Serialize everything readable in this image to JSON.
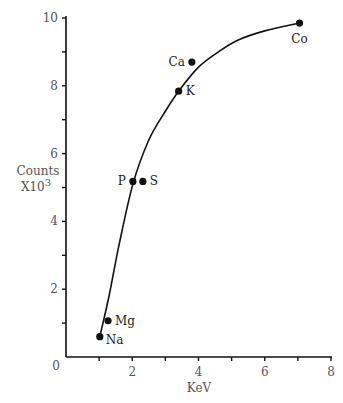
{
  "chart_data": {
    "type": "scatter",
    "title": "",
    "xlabel": "KeV",
    "ylabel_line1": "Counts",
    "ylabel_line2": "X10",
    "ylabel_sup": "3",
    "xlim": [
      0,
      8
    ],
    "ylim": [
      0,
      10
    ],
    "x_ticks": [
      0,
      1,
      2,
      3,
      4,
      5,
      6,
      7,
      8
    ],
    "x_tick_labels": [
      "0",
      "",
      "2",
      "",
      "4",
      "",
      "6",
      "",
      "8"
    ],
    "y_ticks": [
      0,
      1,
      2,
      3,
      4,
      5,
      6,
      7,
      8,
      9,
      10
    ],
    "y_tick_labels": [
      "",
      "",
      "2",
      "",
      "4",
      "",
      "6",
      "",
      "8",
      "",
      "10"
    ],
    "origin_label": "0",
    "grid": false,
    "points": [
      {
        "label": "Na",
        "x": 1.02,
        "y": 0.6,
        "label_pos": "right-below"
      },
      {
        "label": "Mg",
        "x": 1.27,
        "y": 1.07,
        "label_pos": "right"
      },
      {
        "label": "P",
        "x": 2.02,
        "y": 5.18,
        "label_pos": "left"
      },
      {
        "label": "S",
        "x": 2.32,
        "y": 5.18,
        "label_pos": "right"
      },
      {
        "label": "K",
        "x": 3.4,
        "y": 7.84,
        "label_pos": "right"
      },
      {
        "label": "Ca",
        "x": 3.8,
        "y": 8.7,
        "label_pos": "left"
      },
      {
        "label": "Co",
        "x": 7.05,
        "y": 9.85,
        "label_pos": "below"
      }
    ],
    "fit_curve": {
      "x": [
        1.02,
        1.3,
        1.6,
        2.02,
        2.5,
        3.0,
        3.4,
        4.0,
        4.6,
        5.2,
        6.0,
        7.05
      ],
      "y": [
        0.6,
        1.8,
        3.3,
        5.1,
        6.4,
        7.25,
        7.84,
        8.55,
        9.0,
        9.35,
        9.62,
        9.85
      ]
    }
  }
}
